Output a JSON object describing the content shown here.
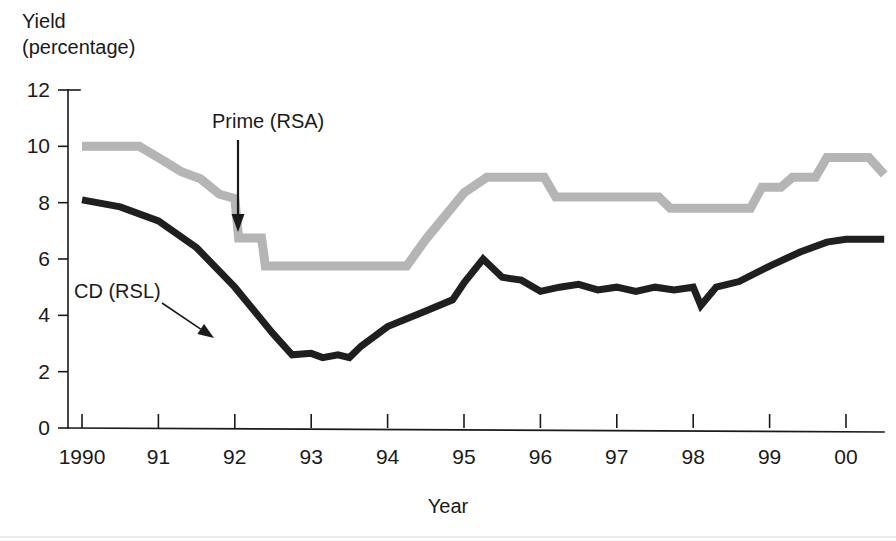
{
  "chart_data": {
    "type": "line",
    "title": "",
    "ylabel": "Yield (percentage)",
    "ylabel_line1": "Yield",
    "ylabel_line2": "(percentage)",
    "xlabel": "Year",
    "xlim": [
      1990,
      2000.5
    ],
    "ylim": [
      0,
      12
    ],
    "yticks": [
      0,
      2,
      4,
      6,
      8,
      10,
      12
    ],
    "ytick_labels": [
      "0",
      "2",
      "4",
      "6",
      "8",
      "10",
      "12"
    ],
    "xticks": [
      1990,
      1991,
      1992,
      1993,
      1994,
      1995,
      1996,
      1997,
      1998,
      1999,
      2000
    ],
    "xtick_labels": [
      "1990",
      "91",
      "92",
      "93",
      "94",
      "95",
      "96",
      "97",
      "98",
      "99",
      "00"
    ],
    "grid": false,
    "legend_position": "inline-annotations",
    "series": [
      {
        "name": "Prime (RSA)",
        "color": "#b5b5b5",
        "stroke_width": 9,
        "x": [
          1990.0,
          1990.75,
          1991.0,
          1991.3,
          1991.55,
          1991.8,
          1992.0,
          1992.05,
          1992.35,
          1992.4,
          1993.0,
          1994.25,
          1994.5,
          1995.0,
          1995.3,
          1995.55,
          1996.05,
          1996.2,
          1997.55,
          1997.7,
          1998.75,
          1998.9,
          1999.15,
          1999.3,
          1999.6,
          1999.75,
          2000.3,
          2000.5
        ],
        "y": [
          10.0,
          10.0,
          9.6,
          9.1,
          8.85,
          8.3,
          8.15,
          6.75,
          6.75,
          5.75,
          5.75,
          5.75,
          6.7,
          8.35,
          8.9,
          8.9,
          8.9,
          8.2,
          8.2,
          7.8,
          7.8,
          8.55,
          8.55,
          8.9,
          8.9,
          9.6,
          9.6,
          9.0
        ]
      },
      {
        "name": "CD (RSL)",
        "color": "#1f1f1f",
        "stroke_width": 7,
        "x": [
          1990.0,
          1990.5,
          1991.0,
          1991.5,
          1992.0,
          1992.5,
          1992.75,
          1993.0,
          1993.15,
          1993.35,
          1993.5,
          1993.65,
          1994.0,
          1994.5,
          1994.85,
          1995.0,
          1995.25,
          1995.5,
          1995.75,
          1996.0,
          1996.25,
          1996.5,
          1996.75,
          1997.0,
          1997.25,
          1997.5,
          1997.75,
          1998.0,
          1998.1,
          1998.3,
          1998.6,
          1999.0,
          1999.4,
          1999.75,
          2000.0,
          2000.5
        ],
        "y": [
          8.1,
          7.85,
          7.35,
          6.4,
          5.0,
          3.35,
          2.6,
          2.65,
          2.5,
          2.6,
          2.5,
          2.9,
          3.6,
          4.15,
          4.55,
          5.15,
          6.0,
          5.35,
          5.25,
          4.85,
          5.0,
          5.1,
          4.9,
          5.0,
          4.85,
          5.0,
          4.9,
          5.0,
          4.35,
          5.0,
          5.2,
          5.75,
          6.25,
          6.6,
          6.7,
          6.7
        ]
      }
    ],
    "annotations": [
      {
        "label": "Prime (RSA)",
        "text_x": 212,
        "text_y": 128,
        "arrow_kind": "vertical-down",
        "arrow_x1": 238,
        "arrow_y1": 140,
        "arrow_x2": 238,
        "arrow_y2": 232
      },
      {
        "label": "CD (RSL)",
        "text_x": 74,
        "text_y": 298,
        "arrow_kind": "diagonal-down-right",
        "arrow_x1": 162,
        "arrow_y1": 303,
        "arrow_x2": 214,
        "arrow_y2": 338
      }
    ]
  },
  "axis": {
    "y_caption_line1": "Yield",
    "y_caption_line2": "(percentage)",
    "x_caption": "Year"
  }
}
